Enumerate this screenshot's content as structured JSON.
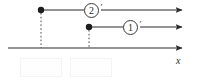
{
  "figure": {
    "type": "number-line-ray-diagram",
    "width": 204,
    "height": 83,
    "background": "#ffffff",
    "stroke_color": "#2b2b2b",
    "dash_color": "#555555",
    "box_border_color": "#f4f4f4"
  },
  "axis": {
    "name": "x",
    "y": 48,
    "x_start": 8,
    "x_end": 185,
    "arrow": "right"
  },
  "rays": [
    {
      "id": "ray-2",
      "label": "2",
      "prime": "′",
      "label_text": "2′",
      "dot_x": 41,
      "y": 10,
      "x_end": 185,
      "arrow": "right",
      "label_center_x": 92,
      "has_dropline": true,
      "dropline_to_y": 48
    },
    {
      "id": "ray-1",
      "label": "1",
      "prime": "′",
      "label_text": "1′",
      "dot_x": 89,
      "y": 27,
      "x_end": 185,
      "arrow": "right",
      "label_center_x": 131,
      "has_dropline": true,
      "dropline_to_y": 48
    }
  ],
  "tick_boxes": [
    {
      "id": "tick-box-left",
      "value": "",
      "x": 20,
      "y": 58,
      "width": 42,
      "height": 19
    },
    {
      "id": "tick-box-right",
      "value": "",
      "x": 70,
      "y": 58,
      "width": 42,
      "height": 19
    }
  ]
}
